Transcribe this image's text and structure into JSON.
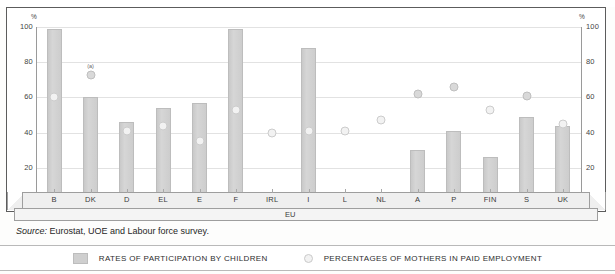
{
  "figure": {
    "ghost_caption": "",
    "source_prefix": "Source:",
    "source_text": " Eurostat, UOE and Labour force survey.",
    "na_marker": "N/A",
    "footnote_marker": "(a)",
    "axis_unit_left": "%",
    "axis_unit_right": "%",
    "group_label": "EU"
  },
  "legend": {
    "bars_label": "RATES OF PARTICIPATION BY CHILDREN",
    "dots_label": "PERCENTAGES OF MOTHERS IN PAID EMPLOYMENT"
  },
  "colors": {
    "bar_fill": "#d2d2d2",
    "dot_fill": "#f2f2f2",
    "grid": "#e2e2e2",
    "axis": "#9a9a9a",
    "text": "#333333"
  },
  "chart_data": {
    "type": "bar",
    "title": "",
    "subtitle": "",
    "xlabel": "EU",
    "ylabel": "%",
    "ylim": [
      0,
      100
    ],
    "yticks": [
      0,
      20,
      40,
      60,
      80,
      100
    ],
    "ytick_labels": [
      "",
      "20",
      "40",
      "60",
      "80",
      "100"
    ],
    "grid": true,
    "legend_position": "bottom",
    "categories": [
      "B",
      "DK",
      "D",
      "EL",
      "E",
      "F",
      "IRL",
      "I",
      "L",
      "NL",
      "A",
      "P",
      "FIN",
      "S",
      "UK"
    ],
    "series": [
      {
        "name": "RATES OF PARTICIPATION BY CHILDREN",
        "type": "bar",
        "values": [
          99,
          60,
          46,
          54,
          57,
          99,
          1,
          88,
          null,
          null,
          30,
          41,
          26,
          49,
          44
        ]
      },
      {
        "name": "PERCENTAGES OF MOTHERS IN PAID EMPLOYMENT",
        "type": "scatter",
        "values": [
          60,
          73,
          41,
          44,
          35,
          53,
          40,
          41,
          41,
          47,
          62,
          66,
          53,
          61,
          45
        ]
      }
    ],
    "annotations": [
      {
        "category": "DK",
        "series": "mothers",
        "text": "(a)",
        "value": 73
      },
      {
        "category": "L",
        "series": "children",
        "text": "N/A",
        "value": null
      }
    ]
  }
}
